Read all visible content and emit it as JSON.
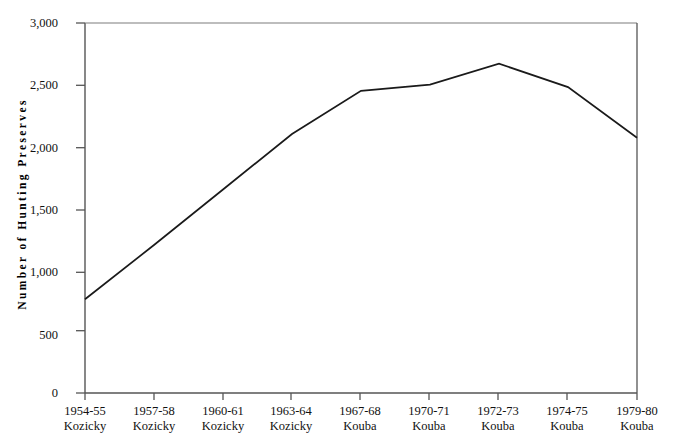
{
  "chart_data": {
    "type": "line",
    "title": "",
    "xlabel": "",
    "ylabel": "Number of Hunting Preserves",
    "categories": [
      "1954-55 Kozicky",
      "1957-58 Kozicky",
      "1960-61 Kozicky",
      "1963-64 Kozicky",
      "1967-68 Kouba",
      "1970-71 Kouba",
      "1972-73 Kouba",
      "1974-75 Kouba",
      "1979-80 Kouba"
    ],
    "category_lines": [
      {
        "period": "1954-55",
        "source": "Kozicky"
      },
      {
        "period": "1957-58",
        "source": "Kozicky"
      },
      {
        "period": "1960-61",
        "source": "Kozicky"
      },
      {
        "period": "1963-64",
        "source": "Kozicky"
      },
      {
        "period": "1967-68",
        "source": "Kouba"
      },
      {
        "period": "1970-71",
        "source": "Kouba"
      },
      {
        "period": "1972-73",
        "source": "Kouba"
      },
      {
        "period": "1974-75",
        "source": "Kouba"
      },
      {
        "period": "1979-80",
        "source": "Kouba"
      }
    ],
    "values": [
      760,
      1200,
      1650,
      2100,
      2450,
      2500,
      2670,
      2480,
      2070
    ],
    "ylim": [
      0,
      3000
    ],
    "yticks": [
      0,
      500,
      1000,
      1500,
      2000,
      2500,
      3000
    ],
    "ytick_labels": [
      "0",
      "500",
      "1,000",
      "1,500",
      "2,000",
      "2,500",
      "3,000"
    ],
    "grid": false,
    "legend": "none",
    "line_color": "#1a1a1a",
    "axis_color": "#555555",
    "background_color": "#ffffff"
  }
}
